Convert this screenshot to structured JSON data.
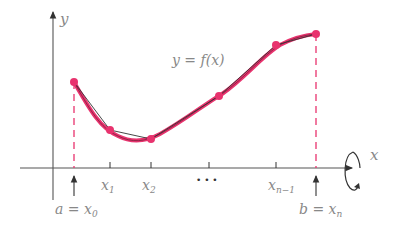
{
  "diagram": {
    "curve_label": "y = f(x)",
    "axis_labels": {
      "x": "x",
      "y": "y"
    },
    "tick_labels": [
      {
        "base": "x",
        "sub": "1"
      },
      {
        "base": "x",
        "sub": "2"
      },
      {
        "base": "x",
        "sub": "n−1"
      }
    ],
    "ellipsis": "• • •",
    "endpoint_labels": {
      "a": {
        "lhs": "a = x",
        "sub": "0"
      },
      "b": {
        "lhs": "b = x",
        "sub": "n"
      }
    },
    "points": [
      [
        74,
        82
      ],
      [
        110,
        130
      ],
      [
        151,
        139
      ],
      [
        219,
        96
      ],
      [
        276,
        45
      ],
      [
        316,
        34
      ]
    ],
    "colors": {
      "curve": "#e8336e",
      "polygon": "#333333",
      "axis": "#333333",
      "label": "#888888"
    },
    "icons": {
      "rotation": "rotation-arrow-icon"
    }
  }
}
